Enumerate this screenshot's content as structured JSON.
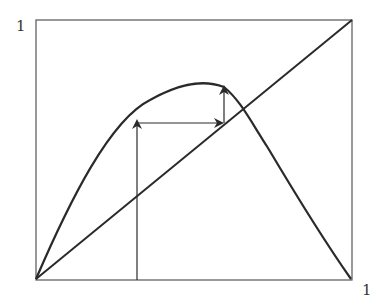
{
  "diagram": {
    "labels": {
      "y_axis_top": "1",
      "x_axis_right": "1"
    },
    "colors": {
      "line": "#2a2a2a",
      "frame": "#555555",
      "background": "#ffffff"
    },
    "frame": {
      "x0": 36,
      "y0": 20,
      "x1": 352,
      "y1": 280
    },
    "elements": [
      {
        "name": "unit-square-frame"
      },
      {
        "name": "diagonal-identity-line",
        "from": [
          0,
          0
        ],
        "to": [
          1,
          1
        ]
      },
      {
        "name": "map-curve",
        "description": "hump-shaped curve rising from origin, peaking near x=0.5 (~0.75), returning to 0 at x=1"
      },
      {
        "name": "cobweb-vertical-1",
        "x": 0.32,
        "from_y": 0,
        "to_y": 0.62,
        "arrow": "up"
      },
      {
        "name": "cobweb-horizontal",
        "y": 0.6,
        "from_x": 0.32,
        "to_x": 0.59,
        "arrow": "right"
      },
      {
        "name": "cobweb-vertical-2",
        "x": 0.59,
        "from_y": 0.6,
        "to_y": 0.75,
        "arrow": "up"
      }
    ]
  }
}
